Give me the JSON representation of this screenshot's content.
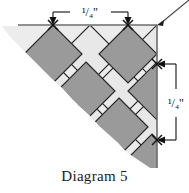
{
  "figure": {
    "caption": "Diagram 5",
    "labels": {
      "top_dimension": "¹/₄\"",
      "right_dimension": "¹/₄\""
    },
    "colors": {
      "dark_diamond": "#9a9a9a",
      "light_diamond": "#e8e8e8",
      "background_fabric": "#ececec",
      "outline": "#2b2b2b",
      "rule_line": "#6b6b6b",
      "page": "#ffffff",
      "caption_text": "#1a1a1a"
    },
    "geometry": {
      "corner_point": {
        "x": 157,
        "y": 25
      },
      "top_rule_y": 25,
      "right_rule_x": 157,
      "diamond_half_diagonal": 29,
      "top_x_marks": [
        {
          "x": 53,
          "y": 25
        },
        {
          "x": 128,
          "y": 25
        }
      ],
      "right_x_marks": [
        {
          "x": 157,
          "y": 64
        },
        {
          "x": 157,
          "y": 140
        }
      ]
    },
    "annotations": {
      "top_dimension_from_x": 53,
      "top_dimension_to_x": 128,
      "right_dimension_from_y": 64,
      "right_dimension_to_y": 140,
      "leader_line": {
        "x1": 189,
        "y1": 0,
        "x2": 159,
        "y2": 25
      }
    },
    "icon_names": {
      "registration_mark": "x-registration-mark-icon",
      "dimension_arrow": "arrow-head-icon",
      "leader": "leader-line-icon"
    }
  }
}
